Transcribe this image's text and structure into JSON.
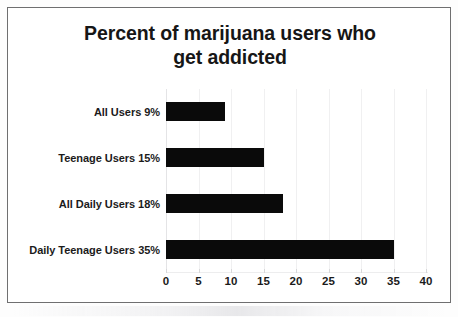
{
  "chart_data": {
    "type": "bar",
    "orientation": "horizontal",
    "title": "Percent of marijuana users who get addicted",
    "title_lines": [
      "Percent of marijuana users who",
      "get addicted"
    ],
    "categories": [
      "All Users 9%",
      "Teenage Users 15%",
      "All Daily Users 18%",
      "Daily Teenage Users 35%"
    ],
    "values": [
      9,
      15,
      18,
      35
    ],
    "xlabel": "",
    "ylabel": "",
    "xlim": [
      0,
      40
    ],
    "xticks": [
      0,
      5,
      10,
      15,
      20,
      25,
      30,
      35,
      40
    ],
    "xtick_labels": [
      "0",
      "5",
      "10",
      "15",
      "20",
      "25",
      "30",
      "35",
      "40"
    ],
    "grid": true,
    "grid_axis": "x",
    "legend": false,
    "bar_color": "#0a0a0a",
    "text_color": "#1b1b1b",
    "frame_color": "#6f6f70",
    "background": "#ffffff"
  }
}
